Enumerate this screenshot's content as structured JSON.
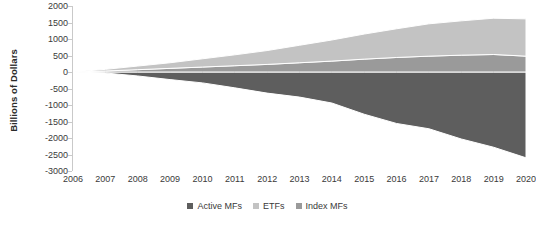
{
  "chart_data": {
    "type": "area",
    "stacked": true,
    "title": "",
    "xlabel": "",
    "ylabel": "Billions of Dollars",
    "categories": [
      2006,
      2007,
      2008,
      2009,
      2010,
      2011,
      2012,
      2013,
      2014,
      2015,
      2016,
      2017,
      2018,
      2019,
      2020
    ],
    "xtick_labels": [
      "2006",
      "2007",
      "2008",
      "2009",
      "2010",
      "2011",
      "2012",
      "2013",
      "2014",
      "2015",
      "2016",
      "2017",
      "2018",
      "2019",
      "2020"
    ],
    "ytick_labels": [
      "2000",
      "1500",
      "1000",
      "500",
      "0",
      "-500",
      "-1000",
      "-1500",
      "-2000",
      "-2500",
      "-3000"
    ],
    "ytick_values": [
      2000,
      1500,
      1000,
      500,
      0,
      -500,
      -1000,
      -1500,
      -2000,
      -2500,
      -3000
    ],
    "ylim": [
      -3000,
      2000
    ],
    "xlim": [
      2006,
      2020
    ],
    "grid": false,
    "legend_position": "bottom",
    "series": [
      {
        "name": "Active MFs",
        "color": "#5e5e5e",
        "values": [
          0,
          -30,
          -120,
          -230,
          -330,
          -480,
          -640,
          -760,
          -940,
          -1280,
          -1560,
          -1720,
          -2030,
          -2280,
          -2600
        ]
      },
      {
        "name": "ETFs",
        "color": "#c3c3c3",
        "values": [
          0,
          50,
          110,
          170,
          250,
          330,
          420,
          530,
          640,
          760,
          870,
          980,
          1040,
          1100,
          1130
        ]
      },
      {
        "name": "Index MFs",
        "color": "#9a9a9a",
        "values": [
          0,
          30,
          70,
          110,
          150,
          190,
          230,
          280,
          330,
          390,
          440,
          480,
          510,
          530,
          480
        ]
      }
    ]
  },
  "legend": {
    "items": [
      {
        "label": "Active MFs",
        "color": "#5e5e5e"
      },
      {
        "label": "ETFs",
        "color": "#c3c3c3"
      },
      {
        "label": "Index MFs",
        "color": "#9a9a9a"
      }
    ]
  },
  "axes": {
    "axis_color": "#c9c9c9",
    "tick_text_color": "#3a3a3a",
    "label_color": "#2b2b2b"
  }
}
